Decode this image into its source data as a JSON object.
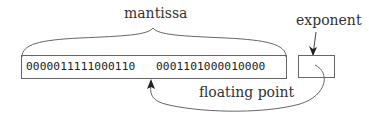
{
  "diagram": {
    "mantissa_label": "mantissa",
    "exponent_label": "exponent",
    "floating_point_label": "floating point",
    "mantissa_bits": {
      "group1": "0000011111000110",
      "group2": "0001101000010000"
    },
    "exponent_value": "",
    "colors": {
      "line": "#666666",
      "text": "#333333",
      "background": "#ffffff"
    }
  }
}
